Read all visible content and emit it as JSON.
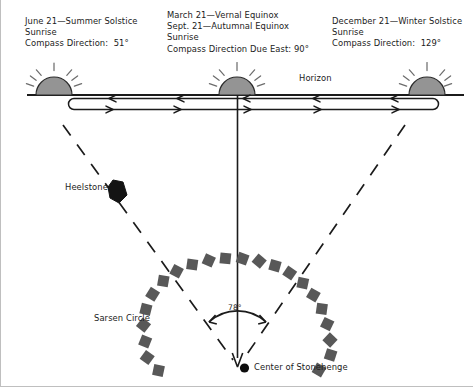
{
  "diagram": {
    "title_semantic": "stonehenge-sunrise-alignment-diagram",
    "labels": {
      "summer_solstice": "June 21—Summer Solstice\nSunrise\nCompass Direction:  51°",
      "equinox": "March 21—Vernal Equinox\nSept. 21—Autumnal Equinox\nSunrise\nCompass Direction Due East: 90°",
      "winter_solstice": "December 21—Winter Solstice\nSunrise\nCompass Direction:  129°",
      "horizon": "Horizon",
      "heelstone": "Heelstone",
      "sarsen_circle": "Sarsen Circle",
      "center": "Center of Stonehenge",
      "angle": "78°"
    },
    "values": {
      "summer_solstice_azimuth": "51°",
      "equinox_azimuth": "90°",
      "winter_solstice_azimuth": "129°",
      "solstice_arc_angle": "78°"
    },
    "icons": {
      "sun_left": "sun-icon",
      "sun_center": "sun-icon",
      "sun_right": "sun-icon",
      "heelstone": "heelstone-marker-icon",
      "center_point": "center-point-icon",
      "sarsen_stone": "sarsen-stone-icon"
    },
    "colors": {
      "sun_fill": "#8c8c8c",
      "stone_fill": "#5a5a5a",
      "heelstone_fill": "#1a1a1a",
      "line": "#1b1b1b",
      "border": "#bfbfbf",
      "background": "#ffffff"
    },
    "counts": {
      "sarsen_stones": 21,
      "horizon_arrow_heads_top": 5,
      "horizon_arrow_heads_bottom": 5
    }
  }
}
